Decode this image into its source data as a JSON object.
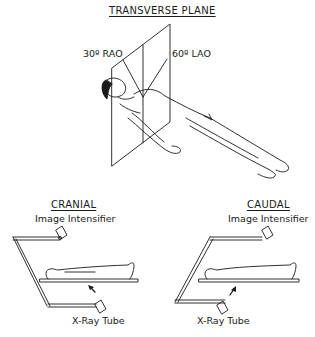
{
  "top_panel": {
    "title": "TRANSVERSE PLANE",
    "angle_left": "30º RAO",
    "angle_right": "60º LAO"
  },
  "cranial_panel": {
    "title": "CRANIAL",
    "top_label": "Image Intensifier",
    "bottom_label": "X-Ray Tube"
  },
  "caudal_panel": {
    "title": "CAUDAL",
    "top_label": "Image Intensifier",
    "bottom_label": "X-Ray Tube"
  },
  "colors": {
    "ink": "#1a1a1a",
    "background": "#ffffff"
  }
}
